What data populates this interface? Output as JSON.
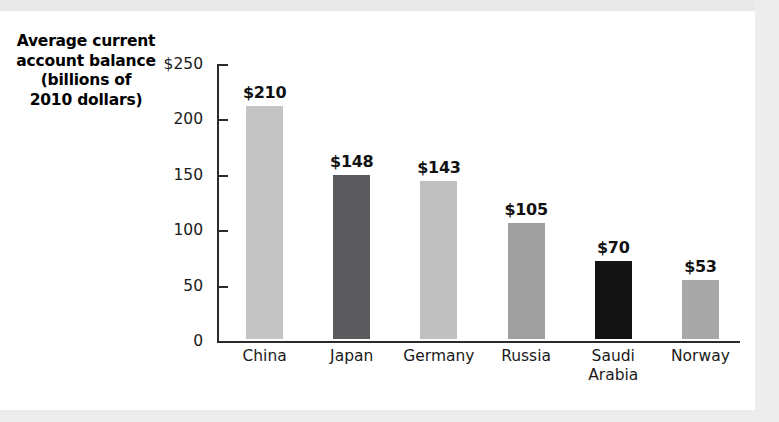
{
  "chart_data": {
    "type": "bar",
    "title_lines": [
      "Average current",
      "account balance",
      "(billions of",
      "2010 dollars)"
    ],
    "xlabel": "",
    "ylabel": "Average current account balance (billions of 2010 dollars)",
    "ylim": [
      0,
      250
    ],
    "grid": false,
    "legend": "none",
    "y_ticks": [
      {
        "value": 250,
        "label": "$250"
      },
      {
        "value": 200,
        "label": "200"
      },
      {
        "value": 150,
        "label": "150"
      },
      {
        "value": 100,
        "label": "100"
      },
      {
        "value": 50,
        "label": "50"
      },
      {
        "value": 0,
        "label": "0"
      }
    ],
    "categories": [
      "China",
      "Japan",
      "Germany",
      "Russia",
      "Saudi\nArabia",
      "Norway"
    ],
    "values": [
      210,
      148,
      143,
      105,
      70,
      53
    ],
    "value_labels": [
      "$210",
      "$148",
      "$143",
      "$105",
      "$70",
      "$53"
    ],
    "bar_colors": [
      "#c4c4c4",
      "#5b5b5f",
      "#c0c0c0",
      "#a0a0a0",
      "#141414",
      "#a8a8a8"
    ]
  },
  "colors": {
    "axis": "#2b2b2b",
    "text": "#1a1a1a",
    "page_background": "#ffffff",
    "scan_band": "#e9e9e9"
  }
}
